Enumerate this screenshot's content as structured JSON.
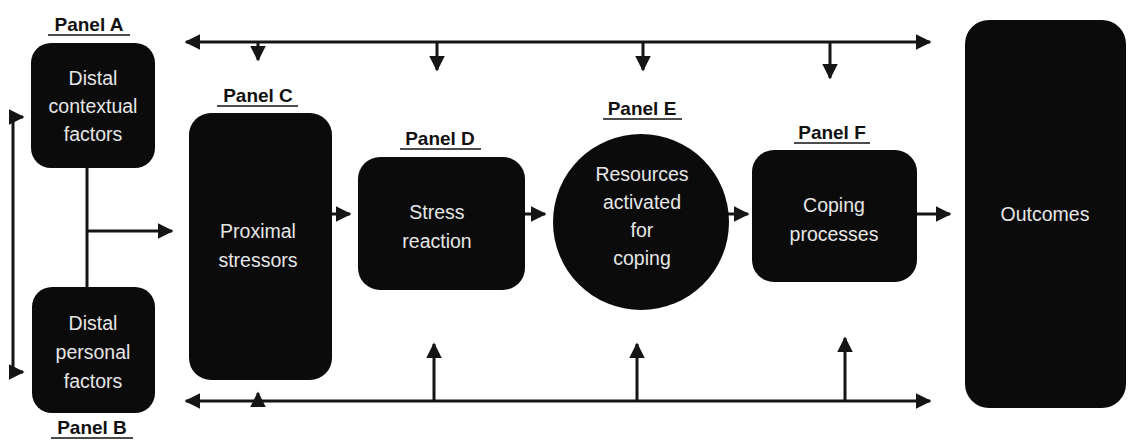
{
  "diagram": {
    "colors": {
      "node_fill": "#0b0b0b",
      "node_text": "#e6e6e6",
      "line": "#151515",
      "label": "#111111"
    },
    "panels": [
      {
        "id": "A",
        "label": "Panel A",
        "lines": [
          "Distal",
          "contextual",
          "factors"
        ],
        "shape": "rounded-rect"
      },
      {
        "id": "B",
        "label": "Panel B",
        "lines": [
          "Distal",
          "personal",
          "factors"
        ],
        "shape": "rounded-rect"
      },
      {
        "id": "C",
        "label": "Panel C",
        "lines": [
          "Proximal",
          "stressors"
        ],
        "shape": "rounded-rect"
      },
      {
        "id": "D",
        "label": "Panel D",
        "lines": [
          "Stress",
          "reaction"
        ],
        "shape": "rounded-rect"
      },
      {
        "id": "E",
        "label": "Panel E",
        "lines": [
          "Resources",
          "activated",
          "for",
          "coping"
        ],
        "shape": "circle"
      },
      {
        "id": "F",
        "label": "Panel F",
        "lines": [
          "Coping",
          "processes"
        ],
        "shape": "rounded-rect"
      }
    ],
    "outcomes": {
      "lines": [
        "Outcomes"
      ],
      "shape": "rounded-rect"
    },
    "connections": [
      {
        "from": "A+B",
        "to": "C",
        "type": "arrow"
      },
      {
        "from": "C",
        "to": "D",
        "type": "arrow"
      },
      {
        "from": "D",
        "to": "E",
        "type": "arrow"
      },
      {
        "from": "E",
        "to": "F",
        "type": "arrow"
      },
      {
        "from": "F",
        "to": "Outcomes",
        "type": "arrow"
      },
      {
        "from": "top-bus",
        "to": [
          "A",
          "Outcomes"
        ],
        "type": "bidirectional",
        "drops_to": [
          "C",
          "D",
          "E",
          "F"
        ]
      },
      {
        "from": "bottom-bus",
        "to": [
          "B",
          "Outcomes"
        ],
        "type": "bidirectional",
        "rises_to": [
          "C",
          "D",
          "E",
          "F"
        ]
      },
      {
        "from": "left-bus",
        "to": [
          "A",
          "B"
        ],
        "type": "bidirectional"
      }
    ]
  }
}
